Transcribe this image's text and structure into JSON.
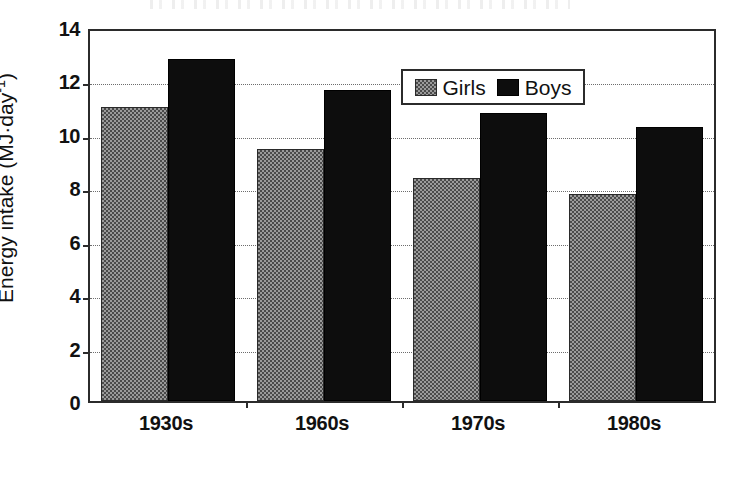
{
  "chart_data": {
    "type": "bar",
    "title": "",
    "xlabel": "",
    "ylabel": "Energy intake (MJ·day",
    "ylabel_exponent": "-1",
    "ylabel_suffix": ")",
    "categories": [
      "1930s",
      "1960s",
      "1970s",
      "1980s"
    ],
    "series": [
      {
        "name": "Girls",
        "values": [
          11.0,
          9.45,
          8.35,
          7.75
        ],
        "color": "#9a9a9a",
        "pattern": "checkerboard"
      },
      {
        "name": "Boys",
        "values": [
          12.8,
          11.65,
          10.8,
          10.25
        ],
        "color": "#0d0d0d",
        "pattern": "solid"
      }
    ],
    "ylim": [
      0,
      14
    ],
    "yticks": [
      0,
      2,
      4,
      6,
      8,
      10,
      12,
      14
    ],
    "ytick_labels": [
      "0",
      "2",
      "4",
      "6",
      "8",
      "10",
      "12",
      "14"
    ],
    "grid": "horizontal-dotted",
    "legend_position": "top-center",
    "frame": true
  },
  "legend": {
    "entries": [
      {
        "label": "Girls",
        "swatch": "girls-pattern-swatch"
      },
      {
        "label": "Boys",
        "swatch": "boys-solid-swatch"
      }
    ]
  }
}
